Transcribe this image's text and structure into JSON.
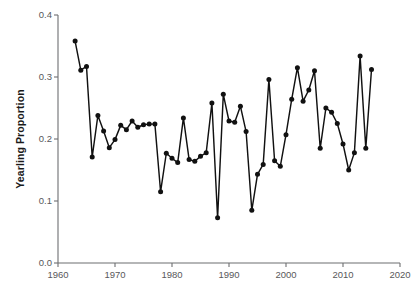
{
  "chart_data": {
    "type": "line",
    "title": "",
    "xlabel": "",
    "ylabel": "Yearling Proportion",
    "xlim": [
      1960,
      2020
    ],
    "ylim": [
      0.0,
      0.4
    ],
    "xticks": [
      1960,
      1970,
      1980,
      1990,
      2000,
      2010,
      2020
    ],
    "xtick_labels": [
      "1960",
      "1970",
      "1980",
      "1990",
      "2000",
      "2010",
      "2020"
    ],
    "yticks": [
      0.0,
      0.1,
      0.2,
      0.3,
      0.4
    ],
    "ytick_labels": [
      "0.0",
      "0.1",
      "0.2",
      "0.3",
      "0.4"
    ],
    "grid": false,
    "legend": null,
    "marker": "filled-circle",
    "line_color": "#111111",
    "marker_color": "#111111",
    "x": [
      1963,
      1964,
      1965,
      1966,
      1967,
      1968,
      1969,
      1970,
      1971,
      1972,
      1973,
      1974,
      1975,
      1976,
      1977,
      1978,
      1979,
      1980,
      1981,
      1982,
      1983,
      1984,
      1985,
      1986,
      1987,
      1988,
      1989,
      1990,
      1991,
      1992,
      1993,
      1994,
      1995,
      1996,
      1997,
      1998,
      1999,
      2000,
      2001,
      2002,
      2003,
      2004,
      2005,
      2006,
      2007,
      2008,
      2009,
      2010,
      2011,
      2012,
      2013,
      2014,
      2015
    ],
    "values": [
      0.358,
      0.311,
      0.317,
      0.171,
      0.238,
      0.213,
      0.186,
      0.199,
      0.222,
      0.215,
      0.229,
      0.219,
      0.223,
      0.224,
      0.224,
      0.115,
      0.177,
      0.169,
      0.162,
      0.234,
      0.167,
      0.164,
      0.172,
      0.178,
      0.258,
      0.073,
      0.272,
      0.229,
      0.227,
      0.253,
      0.212,
      0.085,
      0.143,
      0.159,
      0.296,
      0.165,
      0.156,
      0.207,
      0.264,
      0.315,
      0.261,
      0.279,
      0.31,
      0.185,
      0.25,
      0.243,
      0.225,
      0.192,
      0.15,
      0.178,
      0.334,
      0.185,
      0.312
    ],
    "series_name": "Yearling Proportion"
  },
  "axes": {
    "y_axis_title": "Yearling Proportion"
  }
}
